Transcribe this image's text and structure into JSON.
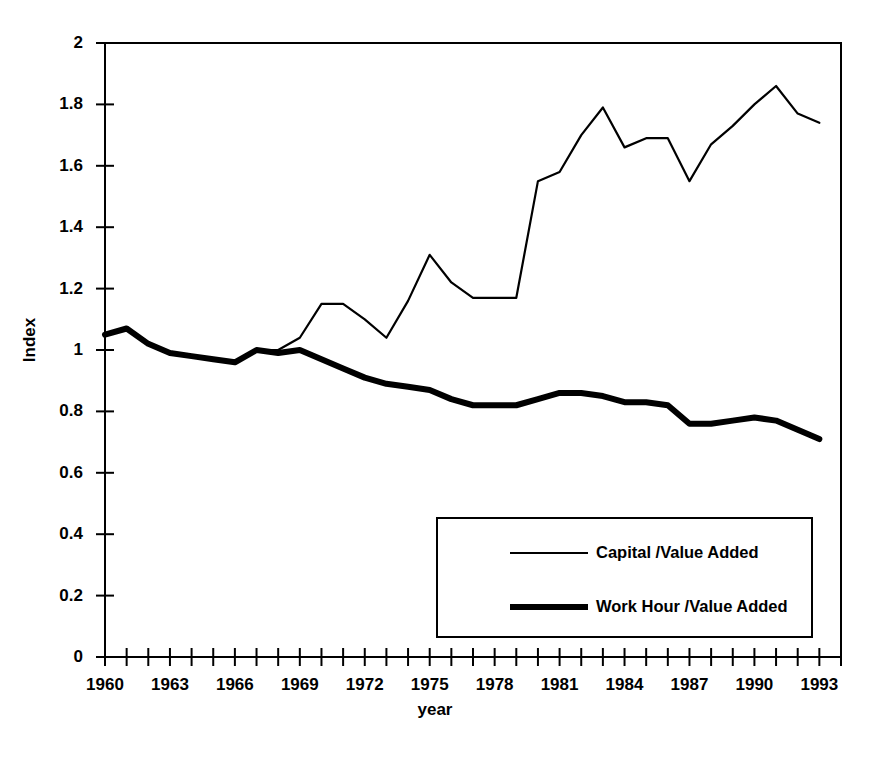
{
  "chart_data": {
    "type": "line",
    "title": "",
    "xlabel": "year",
    "ylabel": "Index",
    "xlim": [
      1960,
      1994
    ],
    "ylim": [
      0,
      2
    ],
    "grid": false,
    "legend_position": "bottom-right",
    "x_tick_labels": [
      "1960",
      "1963",
      "1966",
      "1969",
      "1972",
      "1975",
      "1978",
      "1981",
      "1984",
      "1987",
      "1990",
      "1993"
    ],
    "x_tick_values": [
      1960,
      1963,
      1966,
      1969,
      1972,
      1975,
      1978,
      1981,
      1984,
      1987,
      1990,
      1993
    ],
    "y_tick_labels": [
      "0",
      "0.2",
      "0.4",
      "0.6",
      "0.8",
      "1",
      "1.2",
      "1.4",
      "1.6",
      "1.8",
      "2"
    ],
    "y_tick_values": [
      0,
      0.2,
      0.4,
      0.6,
      0.8,
      1,
      1.2,
      1.4,
      1.6,
      1.8,
      2
    ],
    "x": [
      1960,
      1961,
      1962,
      1963,
      1964,
      1965,
      1966,
      1967,
      1968,
      1969,
      1970,
      1971,
      1972,
      1973,
      1974,
      1975,
      1976,
      1977,
      1978,
      1979,
      1980,
      1981,
      1982,
      1983,
      1984,
      1985,
      1986,
      1987,
      1988,
      1989,
      1990,
      1991,
      1992,
      1993
    ],
    "series": [
      {
        "name": "Capital /Value Added",
        "line_width": "thin",
        "values": [
          1.05,
          1.07,
          1.02,
          0.99,
          0.98,
          0.97,
          0.96,
          1.0,
          1.0,
          1.04,
          1.15,
          1.15,
          1.1,
          1.04,
          1.16,
          1.31,
          1.22,
          1.17,
          1.17,
          1.17,
          1.55,
          1.58,
          1.7,
          1.79,
          1.66,
          1.69,
          1.69,
          1.55,
          1.67,
          1.73,
          1.8,
          1.86,
          1.77,
          1.74
        ]
      },
      {
        "name": "Work Hour /Value Added",
        "line_width": "thick",
        "values": [
          1.05,
          1.07,
          1.02,
          0.99,
          0.98,
          0.97,
          0.96,
          1.0,
          0.99,
          1.0,
          0.97,
          0.94,
          0.91,
          0.89,
          0.88,
          0.87,
          0.84,
          0.82,
          0.82,
          0.82,
          0.84,
          0.86,
          0.86,
          0.85,
          0.83,
          0.83,
          0.82,
          0.76,
          0.76,
          0.77,
          0.78,
          0.77,
          0.74,
          0.71
        ]
      }
    ]
  },
  "legend": {
    "entries": [
      {
        "label": "Capital /Value Added"
      },
      {
        "label": "Work Hour /Value Added"
      }
    ]
  }
}
